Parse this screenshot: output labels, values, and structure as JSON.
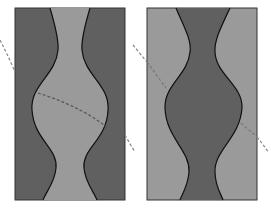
{
  "figure": {
    "colors": {
      "background": "#ffffff",
      "dark_gray": "#606060",
      "light_gray": "#9a9a9a",
      "outline": "#111111",
      "dashed_line": "#6a6a6a"
    },
    "panels": [
      {
        "id": "left",
        "outer_fill": "dark_gray",
        "channel_fill": "light_gray",
        "rect": {
          "x": 15,
          "y": 8,
          "w": 110,
          "h": 192
        }
      },
      {
        "id": "right",
        "outer_fill": "light_gray",
        "channel_fill": "dark_gray",
        "rect": {
          "x": 147,
          "y": 8,
          "w": 110,
          "h": 192
        }
      }
    ]
  }
}
